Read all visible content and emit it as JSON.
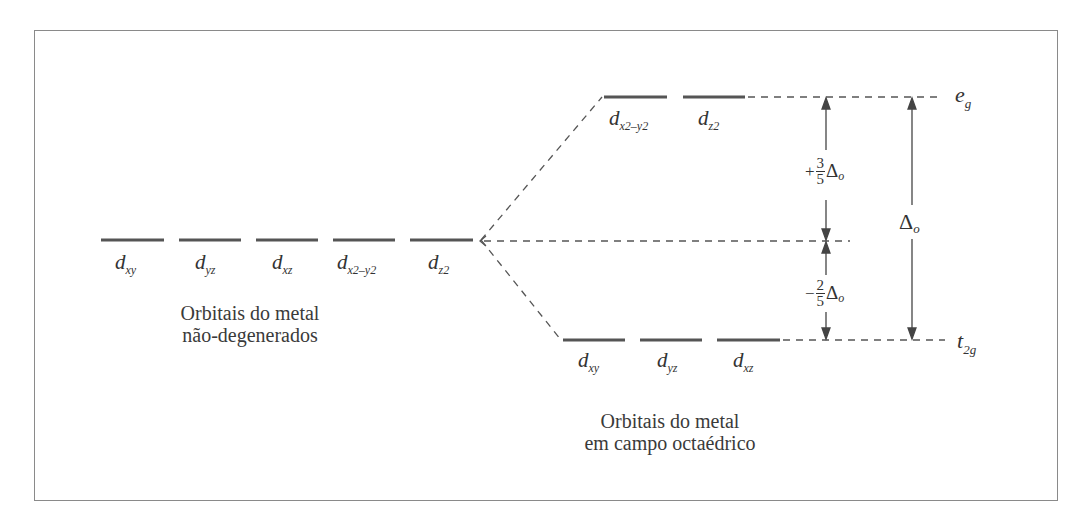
{
  "diagram": {
    "left_group": {
      "caption_line1": "Orbitais do metal",
      "caption_line2": "não-degenerados",
      "orbitals": [
        {
          "base": "d",
          "sub": "xy"
        },
        {
          "base": "d",
          "sub": "yz"
        },
        {
          "base": "d",
          "sub": "xz"
        },
        {
          "base": "d",
          "sub": "x2–y2"
        },
        {
          "base": "d",
          "sub": "z2"
        }
      ]
    },
    "right_group": {
      "caption_line1": "Orbitais do metal",
      "caption_line2": "em campo octaédrico",
      "upper_set": {
        "label_base": "e",
        "label_sub": "g",
        "orbitals": [
          {
            "base": "d",
            "sub": "x2–y2"
          },
          {
            "base": "d",
            "sub": "z2"
          }
        ]
      },
      "lower_set": {
        "label_base": "t",
        "label_sub": "2g",
        "orbitals": [
          {
            "base": "d",
            "sub": "xy"
          },
          {
            "base": "d",
            "sub": "yz"
          },
          {
            "base": "d",
            "sub": "xz"
          }
        ]
      }
    },
    "energy_annotations": {
      "upper_shift": {
        "sign": "+",
        "numerator": "3",
        "denominator": "5",
        "symbol": "Δ",
        "symbol_sub": "o"
      },
      "lower_shift": {
        "sign": "−",
        "numerator": "2",
        "denominator": "5",
        "symbol": "Δ",
        "symbol_sub": "o"
      },
      "total_splitting": {
        "symbol": "Δ",
        "symbol_sub": "o"
      }
    },
    "colors": {
      "line": "#555555",
      "text": "#333333",
      "frame": "#8a8a8a"
    }
  }
}
